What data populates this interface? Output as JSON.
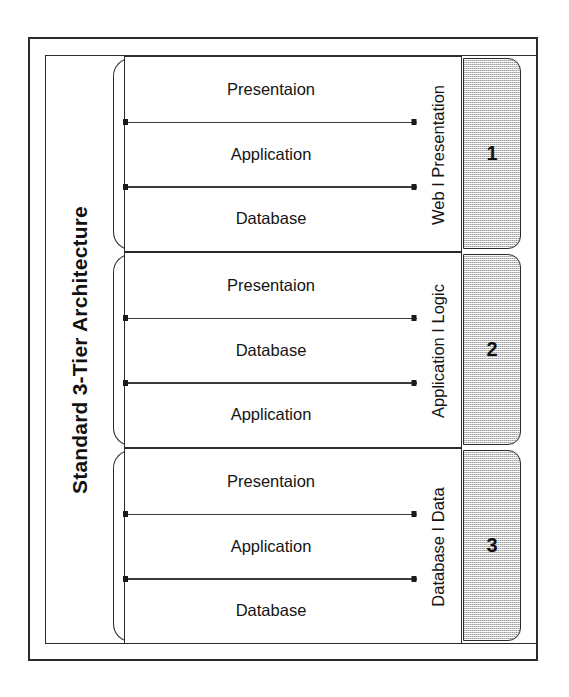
{
  "diagram": {
    "title": "Standard 3-Tier Architecture",
    "colors": {
      "line": "#2b2b2b",
      "text": "#141414",
      "tier_box_fill": "#c9c9c9",
      "background": "#ffffff"
    },
    "tiers": [
      {
        "number": "1",
        "side_label": "Web I Presentation",
        "layers": [
          "Presentaion",
          "Application",
          "Database"
        ]
      },
      {
        "number": "2",
        "side_label": "Application I Logic",
        "layers": [
          "Presentaion",
          "Database",
          "Application"
        ]
      },
      {
        "number": "3",
        "side_label": "Database I Data",
        "layers": [
          "Presentaion",
          "Application",
          "Database"
        ]
      }
    ]
  }
}
